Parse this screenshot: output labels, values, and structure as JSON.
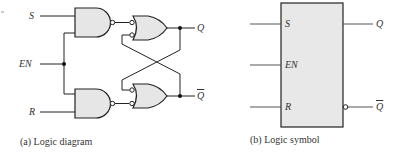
{
  "diagram": {
    "logic_diagram": {
      "caption": "(a)  Logic diagram",
      "inputs": {
        "s": "S",
        "en": "EN",
        "r": "R"
      },
      "outputs": {
        "q": "Q",
        "q_bar": "Q"
      },
      "gates": [
        {
          "id": "nand-s",
          "type": "NAND",
          "inputs": [
            "S",
            "EN"
          ]
        },
        {
          "id": "nand-r",
          "type": "NAND",
          "inputs": [
            "EN",
            "R"
          ]
        },
        {
          "id": "or-q",
          "type": "OR (inverted inputs)",
          "inputs": [
            "nand-s",
            "Q-bar feedback"
          ],
          "output": "Q"
        },
        {
          "id": "or-qbar",
          "type": "OR (inverted inputs)",
          "inputs": [
            "Q feedback",
            "nand-r"
          ],
          "output": "Q-bar"
        }
      ]
    },
    "logic_symbol": {
      "caption": "(b)  Logic symbol",
      "pins": {
        "s": "S",
        "en": "EN",
        "r": "R"
      },
      "outputs": {
        "q": "Q",
        "q_bar": "Q"
      }
    },
    "colors": {
      "gate_fill": "#e6e6e6",
      "line": "#222222",
      "box_fill": "#e8e8e8"
    }
  }
}
